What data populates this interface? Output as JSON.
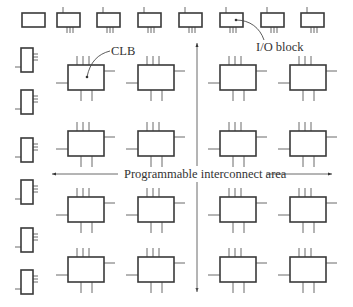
{
  "figure": {
    "labels": {
      "clb": "CLB",
      "io_block": "I/O block",
      "interconnect": "Programmable interconnect area"
    },
    "colors": {
      "block_stroke": "#3a3a3a",
      "pin_stroke": "#6a6a6a",
      "text": "#333333",
      "background": "#ffffff"
    },
    "top_io_blocks": [
      {
        "x": 22,
        "pins": false
      },
      {
        "x": 57,
        "pins": true
      },
      {
        "x": 97,
        "pins": true
      },
      {
        "x": 138,
        "pins": true
      },
      {
        "x": 179,
        "pins": true
      },
      {
        "x": 220,
        "pins": true
      },
      {
        "x": 261,
        "pins": true
      },
      {
        "x": 301,
        "pins": true
      }
    ],
    "left_io_blocks_y": [
      48,
      90,
      138,
      180,
      228,
      270
    ],
    "clb_columns_x": [
      68,
      138,
      220,
      290
    ],
    "clb_rows_y": [
      65,
      131,
      197,
      257
    ],
    "interconnect_arrows": {
      "horizontal": {
        "y": 174,
        "x1": 52,
        "x2": 332
      },
      "vertical": {
        "x": 197,
        "y1": 43,
        "y2": 292
      }
    }
  }
}
